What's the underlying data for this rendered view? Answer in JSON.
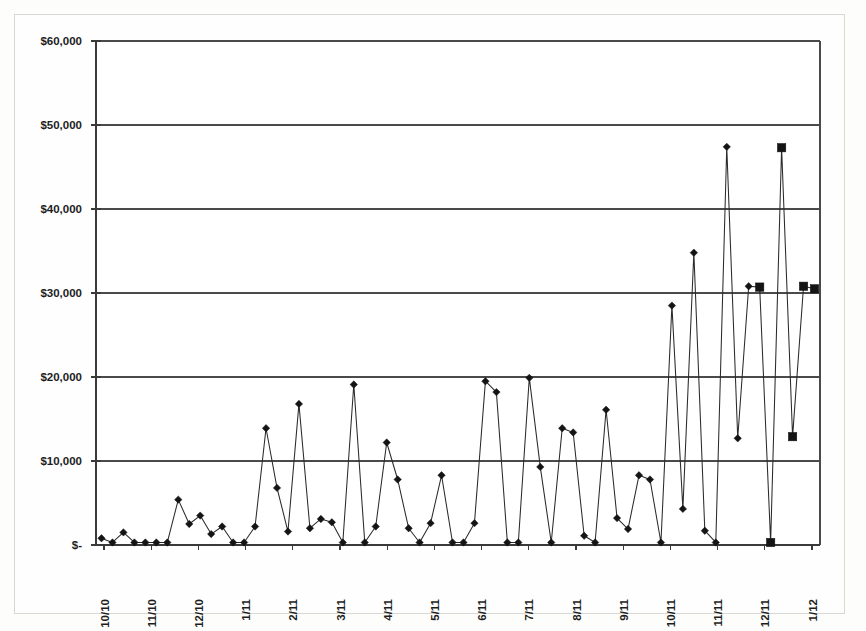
{
  "chart_data": {
    "type": "line",
    "title": "",
    "subtitle": "",
    "xlabel": "",
    "ylabel": "",
    "grid": true,
    "legend": "none",
    "ylim": [
      0,
      60000
    ],
    "ytick_values": [
      0,
      10000,
      20000,
      30000,
      40000,
      50000,
      60000
    ],
    "ytick_labels": [
      "$-",
      "$10,000",
      "$20,000",
      "$30,000",
      "$40,000",
      "$50,000",
      "$60,000"
    ],
    "xtick_labels": [
      "10/10",
      "11/10",
      "12/10",
      "1/11",
      "2/11",
      "3/11",
      "4/11",
      "5/11",
      "6/11",
      "7/11",
      "8/11",
      "9/11",
      "10/11",
      "11/11",
      "12/11",
      "1/12"
    ],
    "x_axis_type": "date-monthly",
    "currency_symbol": "$",
    "marker_styles": [
      "diamond",
      "square"
    ],
    "series": [
      {
        "name": "Series 1",
        "marker": "diamond",
        "values": [
          800,
          300,
          1500,
          300,
          300,
          300,
          300,
          5400,
          2500,
          3500,
          1300,
          2200,
          300,
          300,
          2200,
          13900,
          6800,
          1600,
          16800,
          2000,
          3100,
          2700,
          300,
          19100,
          300,
          2200,
          12200,
          7800,
          2000,
          300,
          2600,
          8300,
          300,
          300,
          2600,
          19500,
          18200,
          300,
          300,
          19900,
          9300,
          300,
          13900,
          13400,
          1100,
          300,
          16100,
          3200,
          1900,
          8300,
          7800,
          300,
          28500,
          4300,
          34800,
          1700,
          300,
          47400,
          12700,
          30800
        ]
      },
      {
        "name": "Series 2",
        "marker": "square",
        "values": [
          30700,
          300,
          47300,
          12900,
          30800,
          30500
        ]
      }
    ],
    "series1_point_count": 60,
    "series2_point_count": 6,
    "max_value": 47400,
    "min_value": 300
  },
  "geometry": {
    "plot_left": 96,
    "plot_right": 820,
    "plot_top": 41,
    "plot_bottom": 545
  }
}
